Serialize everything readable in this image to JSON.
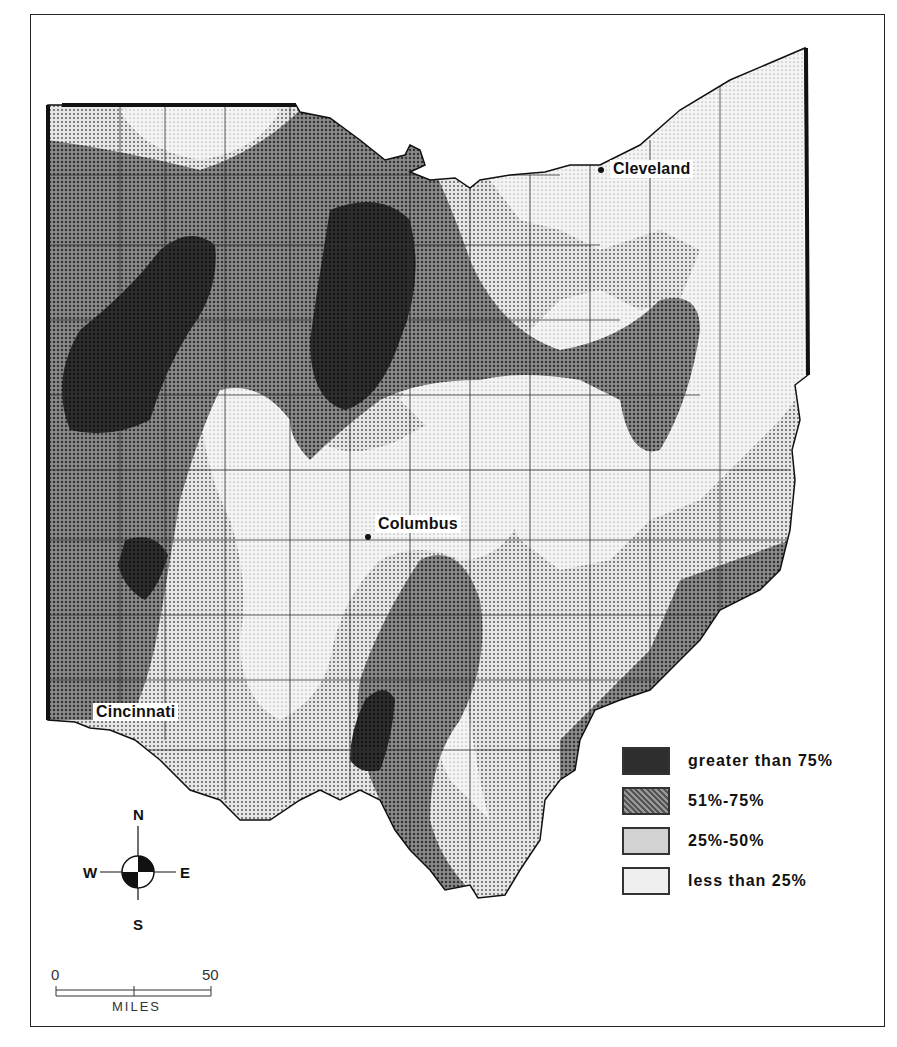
{
  "map": {
    "subject": "Ohio county map with four shaded percentage classes",
    "cities": [
      {
        "name": "Cleveland",
        "x": 601,
        "y": 170
      },
      {
        "name": "Columbus",
        "x": 368,
        "y": 537
      },
      {
        "name": "Cincinnati",
        "x": 90,
        "y": 730
      }
    ]
  },
  "legend": {
    "items": [
      {
        "label": "greater than 75%",
        "fill": "#2a2a2a"
      },
      {
        "label": "51%-75%",
        "fill": "#7a7a7a"
      },
      {
        "label": "25%-50%",
        "fill": "#c8c8c8"
      },
      {
        "label": "less than 25%",
        "fill": "#e9e9e9"
      }
    ]
  },
  "compass": {
    "north": "N",
    "south": "S",
    "east": "E",
    "west": "W"
  },
  "scale": {
    "start": "0",
    "end": "50",
    "unit": "MILES"
  }
}
